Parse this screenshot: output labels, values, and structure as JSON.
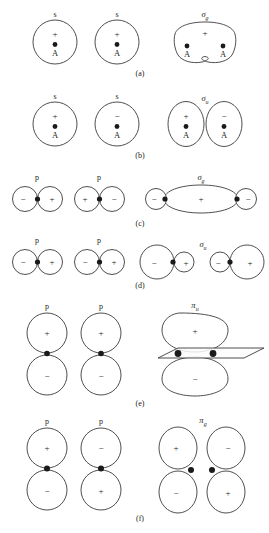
{
  "figure": {
    "panels": [
      {
        "id": "a",
        "caption": "(a)",
        "atomic": [
          {
            "orbital_label": "s",
            "sign": "+",
            "atom_label": "A"
          },
          {
            "orbital_label": "s",
            "sign": "+",
            "atom_label": "A"
          }
        ],
        "molecular": {
          "label": "σ",
          "subscript": "g",
          "lobes": [
            {
              "sign": "+"
            }
          ],
          "atom_labels": [
            "A",
            "A"
          ],
          "shape": "merged-peanut"
        }
      },
      {
        "id": "b",
        "caption": "(b)",
        "atomic": [
          {
            "orbital_label": "s",
            "sign": "+",
            "atom_label": "A"
          },
          {
            "orbital_label": "s",
            "sign": "−",
            "atom_label": "A"
          }
        ],
        "molecular": {
          "label": "σ",
          "subscript": "u",
          "lobes": [
            {
              "sign": "+"
            },
            {
              "sign": "−"
            }
          ],
          "atom_labels": [
            "A",
            "A"
          ],
          "shape": "two-tangent-ellipses"
        }
      },
      {
        "id": "c",
        "caption": "(c)",
        "atomic": [
          {
            "orbital_label": "p",
            "signs": [
              "−",
              "+"
            ]
          },
          {
            "orbital_label": "p",
            "signs": [
              "+",
              "−"
            ]
          }
        ],
        "molecular": {
          "label": "σ",
          "subscript": "g",
          "lobes": [
            {
              "sign": "−"
            },
            {
              "sign": "+"
            },
            {
              "sign": "−"
            }
          ],
          "shape": "small-big-small"
        }
      },
      {
        "id": "d",
        "caption": "(d)",
        "atomic": [
          {
            "orbital_label": "p",
            "signs": [
              "−",
              "+"
            ]
          },
          {
            "orbital_label": "p",
            "signs": [
              "−",
              "+"
            ]
          }
        ],
        "molecular": {
          "label": "σ",
          "subscript": "u",
          "lobes": [
            {
              "sign": "−",
              "size": "big"
            },
            {
              "sign": "+",
              "size": "small"
            },
            {
              "sign": "−",
              "size": "small"
            },
            {
              "sign": "+",
              "size": "big"
            }
          ],
          "shape": "big-small-small-big"
        }
      },
      {
        "id": "e",
        "caption": "(e)",
        "atomic": [
          {
            "orbital_label": "p",
            "signs": [
              "+",
              "−"
            ]
          },
          {
            "orbital_label": "p",
            "signs": [
              "+",
              "−"
            ]
          }
        ],
        "molecular": {
          "label": "π",
          "subscript": "u",
          "lobes": [
            {
              "sign": "+"
            },
            {
              "sign": "−"
            }
          ],
          "shape": "merged-above-below-with-nodal-plane",
          "has_nodal_plane": true
        }
      },
      {
        "id": "f",
        "caption": "(f)",
        "atomic": [
          {
            "orbital_label": "p",
            "signs": [
              "+",
              "−"
            ]
          },
          {
            "orbital_label": "p",
            "signs": [
              "−",
              "+"
            ]
          }
        ],
        "molecular": {
          "label": "π",
          "subscript": "g",
          "lobes": [
            {
              "sign": "+"
            },
            {
              "sign": "−"
            },
            {
              "sign": "−"
            },
            {
              "sign": "+"
            }
          ],
          "shape": "four-separate-lobes"
        }
      }
    ]
  },
  "colors": {
    "stroke": "#3b3b3b",
    "text": "#231f20",
    "nucleus": "#1a1a1a",
    "background": "#ffffff"
  }
}
